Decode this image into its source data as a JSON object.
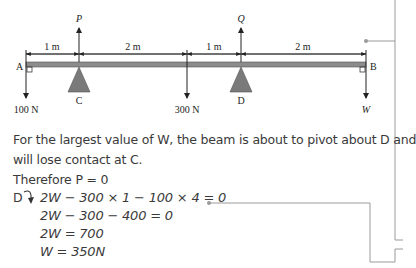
{
  "diagram": {
    "points": {
      "A": "A",
      "B": "B",
      "C": "C",
      "D": "D"
    },
    "forces": {
      "P": "P",
      "Q": "Q",
      "load_A": "100 N",
      "load_mid": "300 N",
      "W": "W"
    },
    "dimensions": [
      "1 m",
      "2 m",
      "1 m",
      "2 m"
    ],
    "colors": {
      "beam": "#8c8c8c",
      "support": "#7a7a7a",
      "lines": "#222222",
      "connector": "#9a9a9a"
    }
  },
  "text": {
    "para_line1": "For the largest value of W, the beam is about to pivot about D and",
    "para_line2": "will lose contact at C.",
    "therefore": "Therefore P = 0",
    "moment_label": "D",
    "equations": [
      "2W − 300 × 1 − 100 × 4 = 0",
      "2W − 300 − 400 = 0",
      "2W = 700",
      "W = 350N"
    ]
  }
}
